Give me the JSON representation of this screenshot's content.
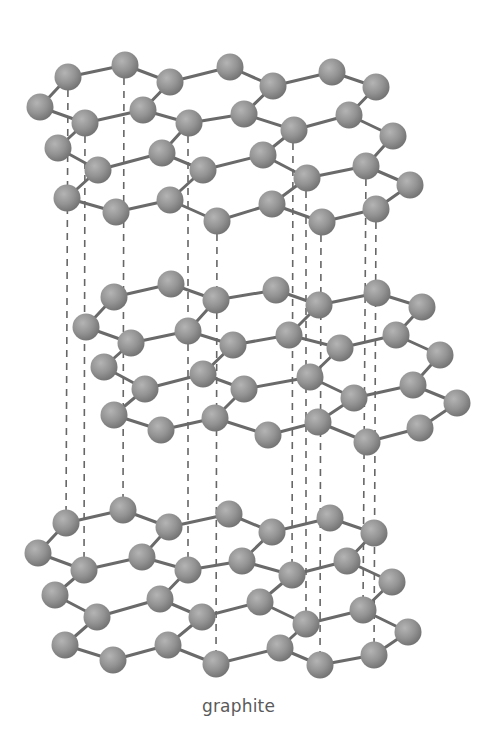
{
  "caption": "graphite",
  "colors": {
    "bond": "#6a6a6a",
    "dash": "#666666",
    "atom_light": "#b4b4b4",
    "atom_mid": "#939393",
    "atom_dark": "#707070",
    "caption": "#5a5a5a"
  },
  "atom_radius": 13.5,
  "layers": [
    {
      "name": "top-layer",
      "rows": [
        [
          [
            40,
            107
          ],
          [
            68,
            77
          ],
          [
            125,
            65
          ],
          [
            170,
            82
          ],
          [
            230,
            67
          ],
          [
            273,
            86
          ],
          [
            332,
            72
          ],
          [
            376,
            87
          ]
        ],
        [
          [
            58,
            148
          ],
          [
            85,
            123
          ],
          [
            143,
            110
          ],
          [
            189,
            123
          ],
          [
            244,
            114
          ],
          [
            294,
            130
          ],
          [
            349,
            115
          ],
          [
            393,
            136
          ]
        ],
        [
          [
            67,
            198
          ],
          [
            98,
            170
          ],
          [
            162,
            153
          ],
          [
            203,
            170
          ],
          [
            263,
            155
          ],
          [
            307,
            178
          ],
          [
            366,
            166
          ],
          [
            410,
            185
          ]
        ],
        [
          [
            116,
            212
          ],
          [
            170,
            200
          ],
          [
            217,
            221
          ],
          [
            272,
            204
          ],
          [
            322,
            222
          ],
          [
            376,
            209
          ]
        ]
      ]
    },
    {
      "name": "middle-layer",
      "rows": [
        [
          [
            86,
            327
          ],
          [
            114,
            297
          ],
          [
            171,
            284
          ],
          [
            216,
            300
          ],
          [
            276,
            290
          ],
          [
            319,
            305
          ],
          [
            377,
            293
          ],
          [
            422,
            307
          ]
        ],
        [
          [
            104,
            367
          ],
          [
            131,
            343
          ],
          [
            188,
            331
          ],
          [
            233,
            345
          ],
          [
            289,
            335
          ],
          [
            340,
            348
          ],
          [
            396,
            335
          ],
          [
            440,
            355
          ]
        ],
        [
          [
            114,
            415
          ],
          [
            145,
            389
          ],
          [
            203,
            374
          ],
          [
            244,
            389
          ],
          [
            310,
            377
          ],
          [
            354,
            398
          ],
          [
            413,
            385
          ],
          [
            457,
            403
          ]
        ],
        [
          [
            161,
            430
          ],
          [
            215,
            418
          ],
          [
            268,
            435
          ],
          [
            318,
            422
          ],
          [
            367,
            442
          ],
          [
            420,
            428
          ]
        ]
      ]
    },
    {
      "name": "bottom-layer",
      "rows": [
        [
          [
            38,
            553
          ],
          [
            66,
            523
          ],
          [
            123,
            510
          ],
          [
            169,
            527
          ],
          [
            229,
            514
          ],
          [
            272,
            532
          ],
          [
            330,
            518
          ],
          [
            374,
            533
          ]
        ],
        [
          [
            55,
            595
          ],
          [
            84,
            570
          ],
          [
            142,
            557
          ],
          [
            188,
            570
          ],
          [
            242,
            561
          ],
          [
            292,
            575
          ],
          [
            347,
            561
          ],
          [
            392,
            582
          ]
        ],
        [
          [
            65,
            645
          ],
          [
            97,
            617
          ],
          [
            160,
            599
          ],
          [
            202,
            617
          ],
          [
            260,
            602
          ],
          [
            306,
            624
          ],
          [
            363,
            610
          ],
          [
            408,
            632
          ]
        ],
        [
          [
            113,
            660
          ],
          [
            168,
            645
          ],
          [
            216,
            664
          ],
          [
            280,
            648
          ],
          [
            320,
            665
          ],
          [
            374,
            655
          ]
        ]
      ]
    }
  ],
  "interlayer_lines": [
    [
      68,
      77,
      66,
      523
    ],
    [
      85,
      123,
      84,
      570
    ],
    [
      124,
      65,
      123,
      510
    ],
    [
      188,
      123,
      188,
      570
    ],
    [
      217,
      221,
      216,
      664
    ],
    [
      293,
      130,
      292,
      575
    ],
    [
      306,
      178,
      306,
      624
    ],
    [
      321,
      222,
      320,
      665
    ],
    [
      366,
      166,
      363,
      610
    ],
    [
      376,
      209,
      374,
      655
    ]
  ]
}
